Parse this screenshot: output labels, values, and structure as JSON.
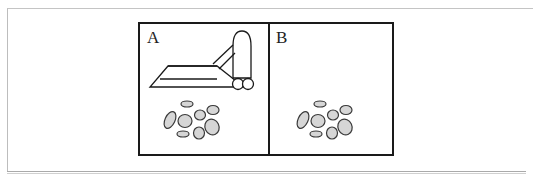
{
  "figure": {
    "panels": [
      {
        "label": "A",
        "contents": [
          "vacuum-cleaner",
          "dust-particles"
        ]
      },
      {
        "label": "B",
        "contents": [
          "dust-particles"
        ]
      }
    ],
    "colors": {
      "stroke": "#1a1a1a",
      "particle_fill": "#d6d6d6",
      "frame": "#bdbdbd"
    }
  }
}
